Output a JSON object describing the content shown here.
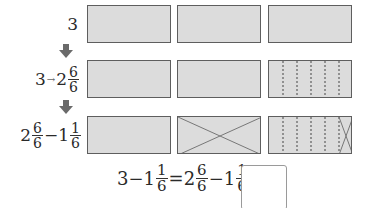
{
  "rows": [
    {
      "label_whole": "3"
    },
    {
      "label_whole": "3",
      "arrow_text": "→",
      "mixed_whole": "2",
      "num": "6",
      "den": "6"
    },
    {
      "mixed_whole": "2",
      "num": "6",
      "den": "6",
      "minus": "−",
      "whole2": "1",
      "num2": "1",
      "den2": "6"
    }
  ],
  "equation": {
    "left_whole": "3",
    "minus1": "−",
    "w1": "1",
    "n1": "1",
    "d1": "6",
    "equals1": "=",
    "w2": "2",
    "n2": "6",
    "d2": "6",
    "minus2": "−",
    "w3": "1",
    "n3": "1",
    "d3": "6",
    "equals2": "="
  },
  "answer": {
    "value": ""
  },
  "colors": {
    "box_fill": "#dcdcdc",
    "box_border": "#5e5e5e",
    "arrow": "#6a6a6a"
  }
}
